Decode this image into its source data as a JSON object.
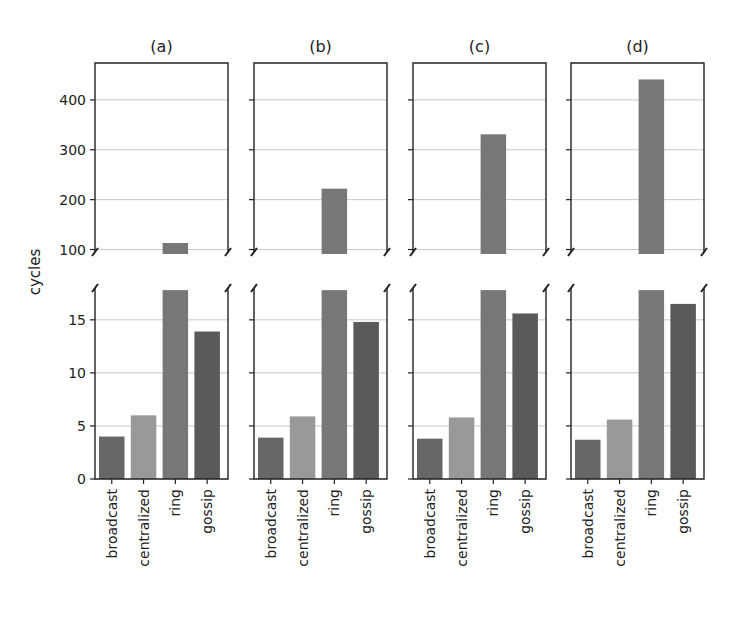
{
  "chart_data": {
    "type": "bar",
    "layout": "broken-axis, 4 panels side by side, each with upper (100-474) and lower (0-18) y-range",
    "ylabel": "cycles",
    "categories": [
      "broadcast",
      "centralized",
      "ring",
      "gossip"
    ],
    "colors": [
      "#666666",
      "#999999",
      "#777777",
      "#5a5a5a"
    ],
    "grid": true,
    "upper_ylim": [
      95,
      474
    ],
    "upper_yticks": [
      100,
      200,
      300,
      400
    ],
    "lower_ylim": [
      0,
      18
    ],
    "lower_yticks": [
      0,
      5,
      10,
      15
    ],
    "panels": [
      {
        "title": "(a)",
        "values": [
          4.0,
          6.0,
          113,
          13.9
        ]
      },
      {
        "title": "(b)",
        "values": [
          3.9,
          5.9,
          222,
          14.8
        ]
      },
      {
        "title": "(c)",
        "values": [
          3.8,
          5.8,
          331,
          15.6
        ]
      },
      {
        "title": "(d)",
        "values": [
          3.7,
          5.6,
          441,
          16.5
        ]
      }
    ]
  },
  "labels": {
    "ylabel": "cycles",
    "upper_ticks": [
      "400",
      "300",
      "200",
      "100"
    ],
    "lower_ticks": [
      "15",
      "10",
      "5",
      "0"
    ],
    "panel_titles": [
      "(a)",
      "(b)",
      "(c)",
      "(d)"
    ],
    "categories": [
      "broadcast",
      "centralized",
      "ring",
      "gossip"
    ]
  }
}
